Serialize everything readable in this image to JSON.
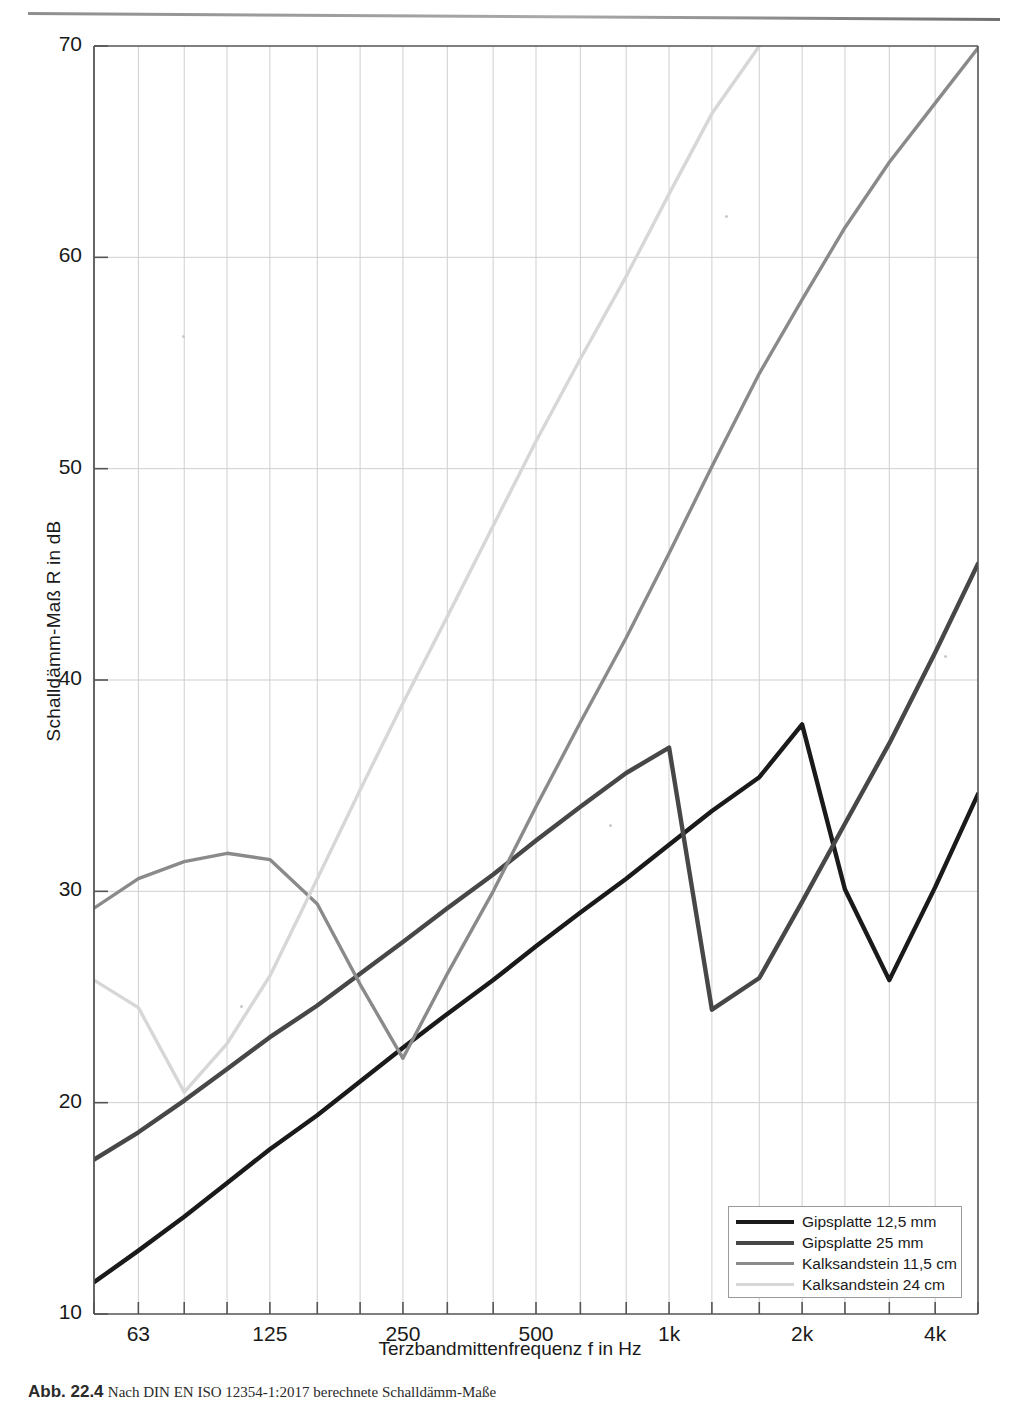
{
  "figure": {
    "top_rule": "horizontal-rule",
    "caption_label": "Abb. 22.4",
    "caption_text": "Nach DIN EN ISO 12354-1:2017 berechnete Schalldämm-Maße"
  },
  "axes": {
    "ylabel": "Schalldämm-Maß R in dB",
    "xlabel": "Terzbandmittenfrequenz f in Hz",
    "ylim": [
      10,
      70
    ],
    "ytick_labels": [
      "70",
      "60",
      "50",
      "40",
      "30",
      "20",
      "10"
    ],
    "yticks": [
      70,
      60,
      50,
      40,
      30,
      20,
      10
    ],
    "xtick_labels": [
      "63",
      "125",
      "250",
      "500",
      "1k",
      "2k",
      "4k"
    ],
    "xticks": [
      63,
      125,
      250,
      500,
      1000,
      2000,
      4000
    ],
    "xlim": [
      50,
      5000
    ],
    "xscale": "log",
    "minor_gridlines": true,
    "grid": "on"
  },
  "legend": {
    "position": "bottom-right",
    "entries": [
      {
        "label": "Gipsplatte 12,5 mm",
        "color": "#1a1a1a",
        "width": 4.2
      },
      {
        "label": "Gipsplatte 25 mm",
        "color": "#474747",
        "width": 4.2
      },
      {
        "label": "Kalksandstein 11,5 cm",
        "color": "#8a8a8a",
        "width": 3.2
      },
      {
        "label": "Kalksandstein 24 cm",
        "color": "#d7d7d7",
        "width": 3.0
      }
    ]
  },
  "chart_data": {
    "type": "line",
    "title": "",
    "xlabel": "Terzbandmittenfrequenz f in Hz",
    "ylabel": "Schalldämm-Maß R in dB",
    "xscale": "log",
    "xlim": [
      50,
      5000
    ],
    "ylim": [
      10,
      70
    ],
    "x": [
      50,
      63,
      80,
      100,
      125,
      160,
      200,
      250,
      315,
      400,
      500,
      630,
      800,
      1000,
      1250,
      1600,
      2000,
      2500,
      3150,
      4000,
      5000
    ],
    "series": [
      {
        "name": "Gipsplatte 12,5 mm",
        "color": "#1a1a1a",
        "values": [
          11.5,
          13.0,
          14.6,
          16.2,
          17.8,
          19.4,
          21.0,
          22.6,
          24.2,
          25.8,
          27.4,
          29.0,
          30.6,
          32.2,
          33.8,
          35.4,
          37.9,
          30.1,
          25.8,
          30.2,
          34.6
        ]
      },
      {
        "name": "Gipsplatte 25 mm",
        "color": "#474747",
        "values": [
          17.3,
          18.6,
          20.1,
          21.6,
          23.1,
          24.6,
          26.1,
          27.6,
          29.2,
          30.8,
          32.4,
          34.0,
          35.6,
          36.8,
          24.4,
          25.9,
          29.5,
          33.2,
          37.0,
          41.3,
          45.5
        ]
      },
      {
        "name": "Kalksandstein 11,5 cm",
        "color": "#8a8a8a",
        "values": [
          29.2,
          30.6,
          31.4,
          31.8,
          31.5,
          29.4,
          25.6,
          22.1,
          26.1,
          30.0,
          34.0,
          38.0,
          42.0,
          46.0,
          50.1,
          54.5,
          58.0,
          61.4,
          64.5,
          67.3,
          69.9
        ]
      },
      {
        "name": "Kalksandstein 24 cm",
        "color": "#d7d7d7",
        "values": [
          25.8,
          24.5,
          20.5,
          22.8,
          26.0,
          30.6,
          34.8,
          38.9,
          43.0,
          47.3,
          51.3,
          55.2,
          59.1,
          63.0,
          66.8,
          70.0,
          null,
          null,
          null,
          null,
          null
        ]
      }
    ]
  }
}
